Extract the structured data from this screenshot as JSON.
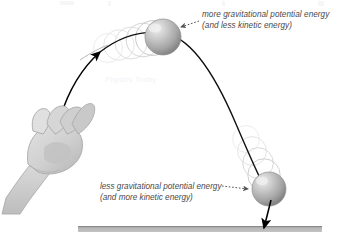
{
  "figure": {
    "type": "physics-diagram",
    "background_color": "#ffffff"
  },
  "annotations": {
    "top": {
      "line1": "more gravitational potential energy",
      "line2": "(and less kinetic energy)",
      "leader": "dotted-arrow-left"
    },
    "bottom": {
      "line1": "less gravitational potential energy",
      "line2": "(and more kinetic energy)",
      "leader": "dotted-arrow-right"
    }
  },
  "objects": {
    "hand_label": "open hand tossing ball",
    "ball_apex_label": "ball at apex",
    "ball_descending_label": "ball descending",
    "ground_label": "ground surface",
    "trajectory_label": "parabolic trajectory path",
    "velocity_arrow_label": "downward motion arrow"
  },
  "colors": {
    "ball_light": "#e8e8e8",
    "ball_mid": "#b2b2b2",
    "ball_dark": "#8a8a8a",
    "ghost_stroke": "#d5d5d5",
    "hand_fill": "#d9d9d9",
    "hand_shade": "#b9b9b9",
    "hand_stroke": "#a8a8a8",
    "ground_top": "#8f8f8f",
    "ground_body": "#b9b9b9",
    "path_stroke": "#000000",
    "text": "#4a4a4a"
  },
  "geometry": {
    "ground_x1": 78,
    "ground_x2": 322,
    "ground_y": 228,
    "ball_apex": {
      "cx": 163,
      "cy": 37,
      "r": 18
    },
    "ball_descend": {
      "cx": 269,
      "cy": 189,
      "r": 17
    }
  }
}
